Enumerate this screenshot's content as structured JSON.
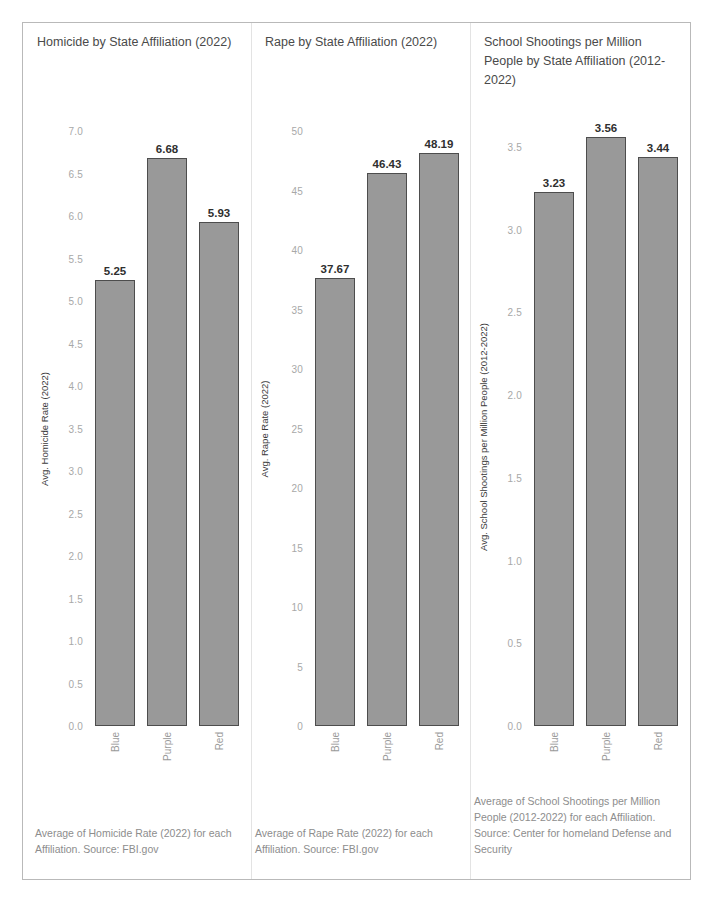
{
  "dashboard": {
    "background": "#ffffff",
    "border_color": "#b9b9b9",
    "bar_fill": "#999999",
    "bar_stroke": "#4d4d4d",
    "tick_color": "#a8a8a8",
    "label_color": "#8d8d8d"
  },
  "charts": [
    {
      "title": "Homicide by State Affiliation (2022)",
      "footnote": "Average of Homicide Rate (2022) for each Affiliation.\nSource: FBI.gov"
    },
    {
      "title": "Rape by State Affiliation (2022)",
      "footnote": "Average of Rape Rate (2022) for each Affiliation.\nSource: FBI.gov"
    },
    {
      "title": "School Shootings per Million People by State Affiliation (2012-2022)",
      "footnote": "Average of School Shootings per Million People (2012-2022) for each Affiliation.\nSource: Center for homeland Defense and Security"
    }
  ],
  "chart_data": [
    {
      "type": "bar",
      "title": "Homicide by State Affiliation (2022)",
      "xlabel": "",
      "ylabel": "Avg. Homicide Rate (2022)",
      "categories": [
        "Blue",
        "Purple",
        "Red"
      ],
      "values": [
        5.25,
        6.68,
        5.93
      ],
      "value_labels": [
        "5.25",
        "6.68",
        "5.93"
      ],
      "ylim": [
        0.0,
        7.0
      ],
      "yticks": [
        0.0,
        0.5,
        1.0,
        1.5,
        2.0,
        2.5,
        3.0,
        3.5,
        4.0,
        4.5,
        5.0,
        5.5,
        6.0,
        6.5,
        7.0
      ],
      "ytick_labels": [
        "0.0",
        "0.5",
        "1.0",
        "1.5",
        "2.0",
        "2.5",
        "3.0",
        "3.5",
        "4.0",
        "4.5",
        "5.0",
        "5.5",
        "6.0",
        "6.5",
        "7.0"
      ],
      "grid": false,
      "legend": "none",
      "bar_color": "#999999"
    },
    {
      "type": "bar",
      "title": "Rape by State Affiliation (2022)",
      "xlabel": "",
      "ylabel": "Avg. Rape Rate (2022)",
      "categories": [
        "Blue",
        "Purple",
        "Red"
      ],
      "values": [
        37.67,
        46.43,
        48.19
      ],
      "value_labels": [
        "37.67",
        "46.43",
        "48.19"
      ],
      "ylim": [
        0,
        50
      ],
      "yticks": [
        0,
        5,
        10,
        15,
        20,
        25,
        30,
        35,
        40,
        45,
        50
      ],
      "ytick_labels": [
        "0",
        "5",
        "10",
        "15",
        "20",
        "25",
        "30",
        "35",
        "40",
        "45",
        "50"
      ],
      "grid": false,
      "legend": "none",
      "bar_color": "#999999"
    },
    {
      "type": "bar",
      "title": "School Shootings per Million People by State Affiliation (2012-2022)",
      "xlabel": "",
      "ylabel": "Avg. School Shootings per Million People (2012-2022)",
      "categories": [
        "Blue",
        "Purple",
        "Red"
      ],
      "values": [
        3.23,
        3.56,
        3.44
      ],
      "value_labels": [
        "3.23",
        "3.56",
        "3.44"
      ],
      "ylim": [
        0.0,
        3.5
      ],
      "yticks": [
        0.0,
        0.5,
        1.0,
        1.5,
        2.0,
        2.5,
        3.0,
        3.5
      ],
      "ytick_labels": [
        "0.0",
        "0.5",
        "1.0",
        "1.5",
        "2.0",
        "2.5",
        "3.0",
        "3.5"
      ],
      "grid": false,
      "legend": "none",
      "bar_color": "#999999"
    }
  ]
}
